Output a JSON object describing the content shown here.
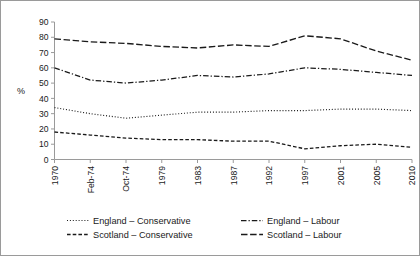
{
  "chart_data": {
    "type": "line",
    "title": "",
    "xlabel": "",
    "ylabel": "%",
    "ylim": [
      0,
      90
    ],
    "ytick_step": 10,
    "grid": false,
    "legend_position": "bottom",
    "categories": [
      "1970",
      "Feb-74",
      "Oct-74",
      "1979",
      "1983",
      "1987",
      "1992",
      "1997",
      "2001",
      "2005",
      "2010"
    ],
    "yticks": [
      "0",
      "10",
      "20",
      "30",
      "40",
      "50",
      "60",
      "70",
      "80",
      "90"
    ],
    "series": [
      {
        "name": "England – Conservative",
        "style": "dotted",
        "values": [
          34,
          30,
          27,
          29,
          31,
          31,
          32,
          32,
          33,
          33,
          32
        ]
      },
      {
        "name": "England – Labour",
        "style": "dash-dot",
        "values": [
          60,
          52,
          50,
          52,
          55,
          54,
          56,
          60,
          59,
          57,
          55
        ]
      },
      {
        "name": "Scotland – Conservative",
        "style": "short-dash",
        "values": [
          18,
          16,
          14,
          13,
          13,
          12,
          12,
          7,
          9,
          10,
          8
        ]
      },
      {
        "name": "Scotland – Labour",
        "style": "long-dash",
        "values": [
          79,
          77,
          76,
          74,
          73,
          75,
          74,
          81,
          79,
          71,
          65
        ]
      }
    ]
  },
  "chart": {
    "y_axis_label": "%",
    "y_tick_labels": [
      "90",
      "80",
      "70",
      "60",
      "50",
      "40",
      "30",
      "20",
      "10",
      "0"
    ],
    "x_tick_labels": [
      "1970",
      "Feb-74",
      "Oct-74",
      "1979",
      "1983",
      "1987",
      "1992",
      "1997",
      "2001",
      "2005",
      "2010"
    ]
  },
  "legend": {
    "entries": [
      {
        "label": "England – Conservative",
        "style": "dotted"
      },
      {
        "label": "England – Labour",
        "style": "dash-dot"
      },
      {
        "label": "Scotland – Conservative",
        "style": "short-dash"
      },
      {
        "label": "Scotland – Labour",
        "style": "long-dash"
      }
    ]
  }
}
